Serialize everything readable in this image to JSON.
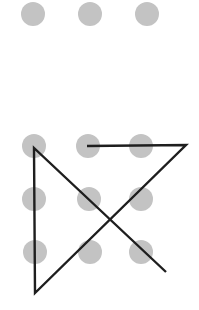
{
  "colors": {
    "dot": "#c3c3c3",
    "line": "#1e1e1e",
    "background": "#ffffff"
  },
  "top_row": {
    "dots": [
      {
        "cx": 33,
        "cy": 14
      },
      {
        "cx": 90,
        "cy": 14
      },
      {
        "cx": 147,
        "cy": 14
      }
    ]
  },
  "pattern_grid": {
    "dots": [
      {
        "cx": 34,
        "cy": 146
      },
      {
        "cx": 88,
        "cy": 146
      },
      {
        "cx": 141,
        "cy": 146
      },
      {
        "cx": 34,
        "cy": 199
      },
      {
        "cx": 89,
        "cy": 199
      },
      {
        "cx": 141,
        "cy": 199
      },
      {
        "cx": 35,
        "cy": 252
      },
      {
        "cx": 90,
        "cy": 252
      },
      {
        "cx": 141,
        "cy": 252
      }
    ],
    "path_points": [
      [
        87,
        146
      ],
      [
        186,
        145
      ],
      [
        35,
        293
      ],
      [
        34,
        148
      ],
      [
        166,
        272
      ]
    ]
  }
}
